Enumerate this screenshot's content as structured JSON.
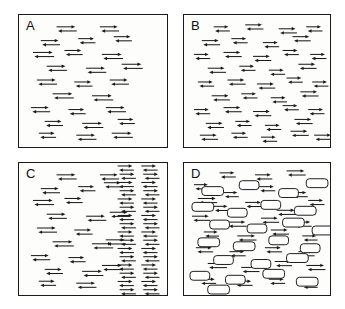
{
  "figure": {
    "type": "scientific-diagram",
    "background_color": "#ffffff",
    "ink_color": "#1a1a1a",
    "panel_fill": "#fdfdfb",
    "panel_count": 4,
    "layout": "2x2 grid"
  },
  "panels": [
    {
      "id": "a",
      "label": "A",
      "arrow_field": "sparse-left-half",
      "barrier": "solid-brick-wall-right",
      "arrow_count": 21,
      "brick_rows": 13,
      "brick_columns": 3
    },
    {
      "id": "b",
      "label": "B",
      "arrow_field": "uniform-sparse-full",
      "barrier": "none",
      "arrow_count": 38,
      "brick_rows": 0,
      "brick_columns": 0
    },
    {
      "id": "c",
      "label": "C",
      "arrow_field": "sparse-left-dense-right",
      "barrier": "none",
      "arrow_count": 55,
      "brick_rows": 0,
      "brick_columns": 0
    },
    {
      "id": "d",
      "label": "D",
      "arrow_field": "uniform-full",
      "barrier": "scattered-bricks",
      "arrow_count": 60,
      "brick_rows": 0,
      "brick_columns": 0
    }
  ],
  "chart_data": {
    "type": "diagram",
    "title": "",
    "glyphs": {
      "arrow_pair": {
        "meaning": "bidirectional flux",
        "top_arrow_direction": "right",
        "bottom_arrow_direction": "left",
        "width_px": 17,
        "height_px": 7
      },
      "brick": {
        "meaning": "impermeable barrier element",
        "shape": "rounded-rectangle",
        "fill": "#ffffff",
        "stroke": "#1a1a1a",
        "width_px": 22,
        "height_px": 9
      }
    },
    "panel_a_arrows": [
      [
        38,
        12
      ],
      [
        82,
        12
      ],
      [
        22,
        26
      ],
      [
        60,
        24
      ],
      [
        96,
        22
      ],
      [
        14,
        38
      ],
      [
        46,
        36
      ],
      [
        84,
        40
      ],
      [
        28,
        52
      ],
      [
        68,
        54
      ],
      [
        104,
        50
      ],
      [
        18,
        66
      ],
      [
        56,
        68
      ],
      [
        92,
        66
      ],
      [
        34,
        80
      ],
      [
        74,
        82
      ],
      [
        12,
        94
      ],
      [
        50,
        96
      ],
      [
        88,
        94
      ],
      [
        26,
        108
      ],
      [
        64,
        110
      ],
      [
        100,
        106
      ],
      [
        20,
        120
      ],
      [
        58,
        122
      ],
      [
        94,
        120
      ]
    ],
    "panel_a_wall": {
      "x": 108,
      "width": 40,
      "rows": 13
    },
    "panel_b_arrows": [
      [
        30,
        12
      ],
      [
        62,
        10
      ],
      [
        96,
        14
      ],
      [
        124,
        12
      ],
      [
        18,
        26
      ],
      [
        48,
        24
      ],
      [
        80,
        28
      ],
      [
        110,
        22
      ],
      [
        10,
        40
      ],
      [
        40,
        38
      ],
      [
        70,
        42
      ],
      [
        100,
        36
      ],
      [
        128,
        40
      ],
      [
        24,
        54
      ],
      [
        56,
        52
      ],
      [
        86,
        56
      ],
      [
        116,
        50
      ],
      [
        14,
        68
      ],
      [
        44,
        66
      ],
      [
        74,
        70
      ],
      [
        104,
        64
      ],
      [
        130,
        68
      ],
      [
        28,
        82
      ],
      [
        58,
        80
      ],
      [
        88,
        84
      ],
      [
        118,
        78
      ],
      [
        10,
        96
      ],
      [
        40,
        94
      ],
      [
        70,
        98
      ],
      [
        100,
        92
      ],
      [
        126,
        96
      ],
      [
        22,
        110
      ],
      [
        52,
        108
      ],
      [
        82,
        112
      ],
      [
        112,
        106
      ],
      [
        16,
        122
      ],
      [
        48,
        120
      ],
      [
        78,
        124
      ],
      [
        108,
        118
      ],
      [
        132,
        122
      ]
    ],
    "panel_c_sparse_arrows": [
      [
        38,
        12
      ],
      [
        82,
        12
      ],
      [
        22,
        26
      ],
      [
        60,
        24
      ],
      [
        14,
        38
      ],
      [
        46,
        36
      ],
      [
        28,
        52
      ],
      [
        68,
        54
      ],
      [
        18,
        66
      ],
      [
        56,
        68
      ],
      [
        34,
        80
      ],
      [
        74,
        82
      ],
      [
        12,
        94
      ],
      [
        50,
        96
      ],
      [
        26,
        108
      ],
      [
        64,
        110
      ],
      [
        20,
        120
      ],
      [
        58,
        122
      ],
      [
        86,
        20
      ],
      [
        92,
        50
      ],
      [
        88,
        78
      ],
      [
        84,
        104
      ]
    ],
    "panel_c_dense": {
      "x_start": 100,
      "columns": 2,
      "rows": 16
    },
    "panel_d_bricks": [
      [
        18,
        24
      ],
      [
        56,
        18
      ],
      [
        96,
        26
      ],
      [
        124,
        16
      ],
      [
        8,
        40
      ],
      [
        44,
        46
      ],
      [
        78,
        38
      ],
      [
        112,
        44
      ],
      [
        26,
        58
      ],
      [
        64,
        62
      ],
      [
        100,
        56
      ],
      [
        130,
        64
      ],
      [
        14,
        76
      ],
      [
        50,
        80
      ],
      [
        86,
        74
      ],
      [
        118,
        82
      ],
      [
        30,
        94
      ],
      [
        68,
        98
      ],
      [
        104,
        92
      ],
      [
        6,
        110
      ],
      [
        42,
        114
      ],
      [
        80,
        108
      ],
      [
        114,
        116
      ],
      [
        24,
        124
      ]
    ],
    "panel_d_arrows": [
      [
        36,
        10
      ],
      [
        72,
        12
      ],
      [
        104,
        8
      ],
      [
        10,
        22
      ],
      [
        40,
        30
      ],
      [
        76,
        24
      ],
      [
        110,
        30
      ],
      [
        14,
        36
      ],
      [
        30,
        44
      ],
      [
        62,
        40
      ],
      [
        94,
        48
      ],
      [
        126,
        38
      ],
      [
        8,
        54
      ],
      [
        44,
        60
      ],
      [
        78,
        56
      ],
      [
        112,
        60
      ],
      [
        20,
        70
      ],
      [
        54,
        74
      ],
      [
        88,
        68
      ],
      [
        120,
        74
      ],
      [
        12,
        86
      ],
      [
        46,
        90
      ],
      [
        82,
        86
      ],
      [
        116,
        90
      ],
      [
        24,
        102
      ],
      [
        58,
        106
      ],
      [
        92,
        100
      ],
      [
        124,
        104
      ],
      [
        16,
        118
      ],
      [
        52,
        120
      ],
      [
        86,
        118
      ],
      [
        120,
        122
      ]
    ]
  }
}
